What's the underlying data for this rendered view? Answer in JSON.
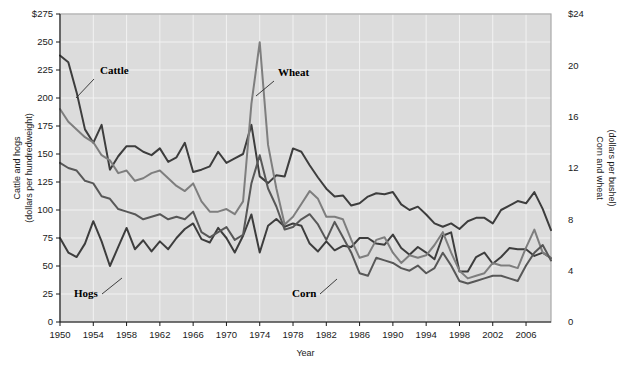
{
  "chart_data": {
    "type": "line",
    "title": "",
    "xlabel": "Year",
    "grid": true,
    "legend_position": "inline-annotations",
    "x_axis": {
      "label": "Year",
      "min": 1950,
      "max": 2009,
      "tick_step": 4,
      "tick_labels": [
        "1950",
        "1954",
        "1958",
        "1962",
        "1966",
        "1970",
        "1974",
        "1978",
        "1982",
        "1986",
        "1990",
        "1994",
        "1998",
        "2002",
        "2006"
      ]
    },
    "y_axis_left": {
      "title_line1": "Cattle and hogs",
      "title_line2": "(dollars per hundredweight)",
      "min": 0,
      "max": 275,
      "tick_step": 25,
      "tick_labels": [
        "$275",
        "250",
        "225",
        "200",
        "175",
        "150",
        "125",
        "100",
        "75",
        "50",
        "25",
        "0"
      ],
      "tick_values": [
        275,
        250,
        225,
        200,
        175,
        150,
        125,
        100,
        75,
        50,
        25,
        0
      ]
    },
    "y_axis_right": {
      "title_line1": "Corn and wheat",
      "title_line2": "(dollars per bushel)",
      "min": 0,
      "max": 24,
      "tick_step": 4,
      "tick_labels": [
        "$24",
        "20",
        "16",
        "12",
        "8",
        "4",
        "0"
      ],
      "tick_values": [
        24,
        20,
        16,
        12,
        8,
        4,
        0
      ]
    },
    "annotations": [
      {
        "text": "Cattle",
        "x": 1953.2,
        "y_left": 238,
        "label_x": 100,
        "label_y": 74,
        "leader_from": [
          94,
          79
        ],
        "leader_to": [
          76,
          98
        ]
      },
      {
        "text": "Wheat",
        "x": 1973.2,
        "y_left": 250,
        "label_x": 278,
        "label_y": 76,
        "leader_from": [
          274,
          81
        ],
        "leader_to": [
          256,
          96
        ]
      },
      {
        "text": "Hogs",
        "x": 1952.0,
        "y_left": 50,
        "label_x": 74,
        "label_y": 297,
        "leader_from": [
          102,
          294
        ],
        "leader_to": [
          122,
          278
        ]
      },
      {
        "text": "Corn",
        "x": 1983.0,
        "y_left": 40,
        "label_x": 292,
        "label_y": 297,
        "leader_from": [
          320,
          294
        ],
        "leader_to": [
          337,
          279
        ]
      }
    ],
    "series": [
      {
        "name": "Cattle",
        "axis": "left",
        "color": "#3d3d3d",
        "width": 2.0,
        "unit": "dollars per hundredweight",
        "x": [
          1950,
          1951,
          1952,
          1953,
          1954,
          1955,
          1956,
          1957,
          1958,
          1959,
          1960,
          1961,
          1962,
          1963,
          1964,
          1965,
          1966,
          1967,
          1968,
          1969,
          1970,
          1971,
          1972,
          1973,
          1974,
          1975,
          1976,
          1977,
          1978,
          1979,
          1980,
          1981,
          1982,
          1983,
          1984,
          1985,
          1986,
          1987,
          1988,
          1989,
          1990,
          1991,
          1992,
          1993,
          1994,
          1995,
          1996,
          1997,
          1998,
          1999,
          2000,
          2001,
          2002,
          2003,
          2004,
          2005,
          2006,
          2007,
          2008,
          2009
        ],
        "values": [
          238,
          232,
          205,
          172,
          160,
          176,
          136,
          148,
          157,
          157,
          152,
          149,
          155,
          143,
          147,
          160,
          134,
          136,
          139,
          152,
          142,
          146,
          150,
          176,
          130,
          124,
          131,
          130,
          155,
          152,
          140,
          129,
          119,
          112,
          113,
          104,
          106,
          112,
          115,
          114,
          116,
          105,
          100,
          103,
          96,
          88,
          85,
          88,
          83,
          90,
          93,
          93,
          88,
          100,
          104,
          108,
          106,
          116,
          101,
          82
        ]
      },
      {
        "name": "Hogs",
        "axis": "left",
        "color": "#3d3d3d",
        "width": 2.0,
        "unit": "dollars per hundredweight",
        "x": [
          1950,
          1951,
          1952,
          1953,
          1954,
          1955,
          1956,
          1957,
          1958,
          1959,
          1960,
          1961,
          1962,
          1963,
          1964,
          1965,
          1966,
          1967,
          1968,
          1969,
          1970,
          1971,
          1972,
          1973,
          1974,
          1975,
          1976,
          1977,
          1978,
          1979,
          1980,
          1981,
          1982,
          1983,
          1984,
          1985,
          1986,
          1987,
          1988,
          1989,
          1990,
          1991,
          1992,
          1993,
          1994,
          1995,
          1996,
          1997,
          1998,
          1999,
          2000,
          2001,
          2002,
          2003,
          2004,
          2005,
          2006,
          2007,
          2008,
          2009
        ],
        "values": [
          75,
          62,
          58,
          70,
          90,
          72,
          50,
          67,
          84,
          65,
          73,
          63,
          72,
          65,
          75,
          83,
          88,
          74,
          71,
          84,
          75,
          62,
          77,
          96,
          62,
          86,
          92,
          85,
          88,
          86,
          70,
          63,
          72,
          64,
          68,
          67,
          75,
          75,
          70,
          69,
          78,
          66,
          60,
          67,
          62,
          56,
          77,
          80,
          45,
          45,
          58,
          62,
          52,
          58,
          66,
          65,
          65,
          59,
          62,
          57
        ]
      },
      {
        "name": "Wheat",
        "axis": "right",
        "color": "#7e7e7e",
        "width": 2.0,
        "unit": "dollars per bushel",
        "x": [
          1950,
          1951,
          1952,
          1953,
          1954,
          1955,
          1956,
          1957,
          1958,
          1959,
          1960,
          1961,
          1962,
          1963,
          1964,
          1965,
          1966,
          1967,
          1968,
          1969,
          1970,
          1971,
          1972,
          1973,
          1974,
          1975,
          1976,
          1977,
          1978,
          1979,
          1980,
          1981,
          1982,
          1983,
          1984,
          1985,
          1986,
          1987,
          1988,
          1989,
          1990,
          1991,
          1992,
          1993,
          1994,
          1995,
          1996,
          1997,
          1998,
          1999,
          2000,
          2001,
          2002,
          2003,
          2004,
          2005,
          2006,
          2007,
          2008,
          2009
        ],
        "values": [
          16.6,
          15.6,
          15.0,
          14.4,
          14.0,
          13.0,
          12.6,
          11.6,
          11.8,
          11.0,
          11.2,
          11.6,
          11.8,
          11.2,
          10.6,
          10.2,
          10.8,
          9.4,
          8.6,
          8.6,
          8.8,
          8.4,
          9.4,
          17.0,
          21.8,
          13.8,
          10.4,
          7.6,
          8.2,
          9.2,
          10.2,
          9.6,
          8.2,
          8.2,
          8.0,
          6.4,
          5.0,
          5.2,
          6.4,
          6.6,
          5.4,
          4.6,
          5.2,
          5.0,
          5.2,
          6.0,
          7.0,
          5.4,
          4.0,
          3.4,
          3.6,
          3.8,
          4.6,
          4.4,
          4.4,
          4.2,
          5.8,
          7.2,
          5.4,
          5.0
        ]
      },
      {
        "name": "Corn",
        "axis": "right",
        "color": "#585858",
        "width": 2.0,
        "unit": "dollars per bushel",
        "x": [
          1950,
          1951,
          1952,
          1953,
          1954,
          1955,
          1956,
          1957,
          1958,
          1959,
          1960,
          1961,
          1962,
          1963,
          1964,
          1965,
          1966,
          1967,
          1968,
          1969,
          1970,
          1971,
          1972,
          1973,
          1974,
          1975,
          1976,
          1977,
          1978,
          1979,
          1980,
          1981,
          1982,
          1983,
          1984,
          1985,
          1986,
          1987,
          1988,
          1989,
          1990,
          1991,
          1992,
          1993,
          1994,
          1995,
          1996,
          1997,
          1998,
          1999,
          2000,
          2001,
          2002,
          2003,
          2004,
          2005,
          2006,
          2007,
          2008,
          2009
        ],
        "values": [
          12.4,
          12.0,
          11.8,
          11.0,
          10.8,
          9.8,
          9.6,
          8.8,
          8.6,
          8.4,
          8.0,
          8.2,
          8.4,
          8.0,
          8.2,
          8.0,
          8.6,
          7.0,
          6.6,
          7.0,
          7.4,
          6.4,
          6.8,
          10.8,
          13.0,
          10.4,
          9.0,
          7.2,
          7.4,
          8.0,
          8.4,
          7.6,
          6.4,
          7.8,
          6.6,
          5.4,
          3.8,
          3.6,
          5.0,
          4.8,
          4.6,
          4.2,
          4.0,
          4.4,
          3.8,
          4.2,
          5.4,
          4.4,
          3.2,
          3.0,
          3.2,
          3.4,
          3.6,
          3.6,
          3.4,
          3.2,
          4.4,
          5.4,
          6.0,
          4.8
        ]
      }
    ]
  },
  "figure": {
    "background_color": "#ffffff",
    "plot_background_color": "#dcdcdc",
    "gridline_color": "#f2f2f2",
    "frame_color": "#a8a8a8"
  }
}
